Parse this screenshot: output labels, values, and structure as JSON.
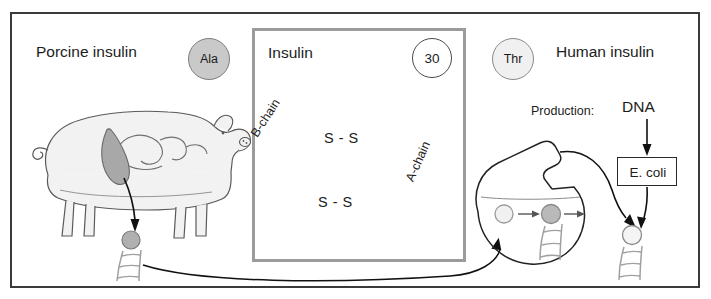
{
  "diagram": {
    "title_left": "Porcine insulin",
    "title_right": "Human insulin",
    "panel_title": "Insulin",
    "residue_left": "Ala",
    "residue_right": "Thr",
    "residue_position": "30",
    "chain_b": "B-chain",
    "chain_a": "A-chain",
    "disulfide_upper": "S - S",
    "disulfide_lower": "S - S",
    "production_label": "Production:",
    "production_source": "DNA",
    "host_organism": "E. coli"
  },
  "icons": {
    "pig": "pig-icon",
    "pancreas": "pancreas-icon",
    "dna_ladder": "dna-ladder-icon",
    "flask": "flask-icon",
    "arrow": "arrow-icon"
  },
  "colors": {
    "frame_border": "#3a3a3a",
    "panel_border": "#9b9b9b",
    "ala_fill": "#c9c9c9",
    "thr_fill": "#f0f0f0",
    "pig_fill": "#f2f2f2",
    "pancreas_fill": "#a8a8a8",
    "bead_stroke": "#808080"
  }
}
